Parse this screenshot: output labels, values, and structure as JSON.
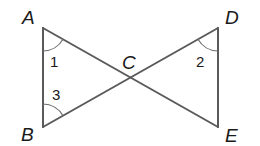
{
  "figure": {
    "line_color": "#5a5a5a",
    "vertices": [
      {
        "id": "A",
        "label": "A"
      },
      {
        "id": "B",
        "label": "B"
      },
      {
        "id": "C",
        "label": "C"
      },
      {
        "id": "D",
        "label": "D"
      },
      {
        "id": "E",
        "label": "E"
      }
    ],
    "segments": [
      {
        "from": "A",
        "to": "B"
      },
      {
        "from": "A",
        "to": "E"
      },
      {
        "from": "B",
        "to": "D"
      },
      {
        "from": "D",
        "to": "E"
      }
    ],
    "angles": [
      {
        "label": "1",
        "vertex": "A",
        "between": [
          "B",
          "C"
        ]
      },
      {
        "label": "3",
        "vertex": "B",
        "between": [
          "A",
          "C"
        ]
      },
      {
        "label": "2",
        "vertex": "D",
        "between": [
          "C",
          "E"
        ]
      }
    ]
  }
}
